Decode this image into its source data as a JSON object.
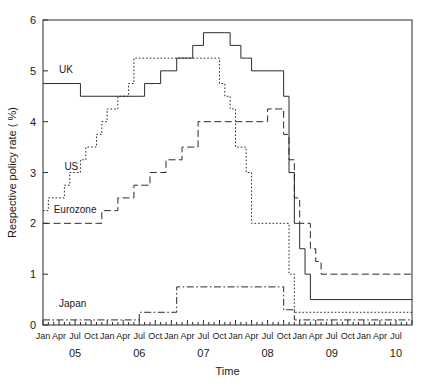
{
  "chart_data": {
    "type": "line",
    "title": "",
    "xlabel": "Time",
    "ylabel": "Respective policy rate ( %)",
    "ylim": [
      0,
      6
    ],
    "yticks": [
      0,
      1,
      2,
      3,
      4,
      5,
      6
    ],
    "ytick_labels": [
      "0",
      "1",
      "2",
      "3",
      "4",
      "5",
      "6"
    ],
    "grid": false,
    "legend_position": "inline-annotations",
    "xlim": [
      "2005-01",
      "2010-10"
    ],
    "xtick_labels": [
      "Jan",
      "Apr",
      "Jul",
      "Oct",
      "Jan",
      "Apr",
      "Jul",
      "Oct",
      "Jan",
      "Apr",
      "Jul",
      "Oct",
      "Jan",
      "Apr",
      "Jul",
      "Oct",
      "Jan",
      "Apr",
      "Jul",
      "Oct",
      "Jan",
      "Apr",
      "Jul"
    ],
    "year_labels": [
      "05",
      "06",
      "07",
      "08",
      "09",
      "10"
    ],
    "series": [
      {
        "name": "UK",
        "style": "solid",
        "label_x": "2005-04",
        "label_y": 4.95,
        "x": [
          "2005-01",
          "2005-07",
          "2005-08",
          "2006-07",
          "2006-08",
          "2006-10",
          "2006-11",
          "2007-01",
          "2007-02",
          "2007-04",
          "2007-05",
          "2007-06",
          "2007-07",
          "2007-11",
          "2007-12",
          "2008-01",
          "2008-02",
          "2008-03",
          "2008-04",
          "2008-09",
          "2008-10",
          "2008-11",
          "2008-12",
          "2009-01",
          "2009-02",
          "2009-03",
          "2010-10"
        ],
        "y": [
          4.75,
          4.75,
          4.5,
          4.5,
          4.75,
          4.75,
          5.0,
          5.0,
          5.25,
          5.25,
          5.5,
          5.5,
          5.75,
          5.75,
          5.5,
          5.5,
          5.25,
          5.25,
          5.0,
          5.0,
          4.5,
          3.0,
          2.0,
          1.5,
          1.0,
          0.5,
          0.5
        ]
      },
      {
        "name": "US",
        "style": "dotted",
        "label_x": "2005-05",
        "label_y": 3.05,
        "x": [
          "2005-01",
          "2005-02",
          "2005-03",
          "2005-05",
          "2005-06",
          "2005-08",
          "2005-09",
          "2005-11",
          "2005-12",
          "2006-01",
          "2006-03",
          "2006-05",
          "2006-06",
          "2007-09",
          "2007-10",
          "2007-11",
          "2007-12",
          "2008-01",
          "2008-03",
          "2008-04",
          "2008-10",
          "2008-11",
          "2008-12",
          "2010-10"
        ],
        "y": [
          2.25,
          2.5,
          2.5,
          2.75,
          3.0,
          3.25,
          3.5,
          3.75,
          4.0,
          4.25,
          4.5,
          4.75,
          5.25,
          5.25,
          4.75,
          4.5,
          4.25,
          3.5,
          3.0,
          2.0,
          2.0,
          1.0,
          0.25,
          0.25
        ]
      },
      {
        "name": "Eurozone",
        "style": "dashed",
        "label_x": "2005-03",
        "label_y": 2.2,
        "x": [
          "2005-01",
          "2005-11",
          "2005-12",
          "2006-02",
          "2006-03",
          "2006-05",
          "2006-06",
          "2006-08",
          "2006-09",
          "2006-11",
          "2006-12",
          "2007-02",
          "2007-03",
          "2007-05",
          "2007-06",
          "2008-06",
          "2008-07",
          "2008-09",
          "2008-10",
          "2008-11",
          "2008-12",
          "2009-01",
          "2009-03",
          "2009-04",
          "2009-05",
          "2010-10"
        ],
        "y": [
          2.0,
          2.0,
          2.25,
          2.25,
          2.5,
          2.5,
          2.75,
          2.75,
          3.0,
          3.0,
          3.25,
          3.25,
          3.5,
          3.5,
          4.0,
          4.0,
          4.25,
          4.25,
          3.75,
          3.25,
          2.5,
          2.0,
          1.5,
          1.25,
          1.0,
          1.0
        ]
      },
      {
        "name": "Japan",
        "style": "dashdot",
        "label_x": "2005-04",
        "label_y": 0.35,
        "x": [
          "2005-01",
          "2006-06",
          "2006-07",
          "2007-01",
          "2007-02",
          "2008-09",
          "2008-10",
          "2008-12",
          "2010-10"
        ],
        "y": [
          0.1,
          0.1,
          0.25,
          0.25,
          0.75,
          0.75,
          0.3,
          0.1,
          0.1
        ]
      }
    ]
  },
  "axis": {
    "y_title": "Respective policy rate ( %)",
    "x_title": "Time"
  }
}
